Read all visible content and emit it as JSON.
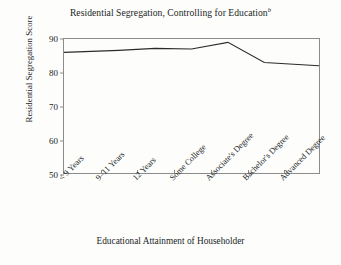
{
  "chart_data": {
    "type": "line",
    "title": "Residential Segregation, Controlling for Education",
    "title_superscript": "b",
    "xlabel": "Educational Attainment of Householder",
    "ylabel": "Residential Segregation Score",
    "categories": [
      "< 9 Years",
      "9–11 Years",
      "12 Years",
      "Some College",
      "Associate's Degree",
      "Bachelor's Degree",
      "Advanced Degree"
    ],
    "values": [
      86,
      86.6,
      87.2,
      87,
      89,
      83,
      82
    ],
    "ylim": [
      50,
      90
    ],
    "yticks": [
      50,
      60,
      70,
      80,
      90
    ],
    "ytick_labels": [
      "50",
      "60",
      "70",
      "80",
      "90"
    ],
    "grid": false,
    "legend": "none",
    "line_color": "#2b2b2b",
    "frame_color": "#8b8b8b",
    "background_color": "#fdfdfc"
  }
}
